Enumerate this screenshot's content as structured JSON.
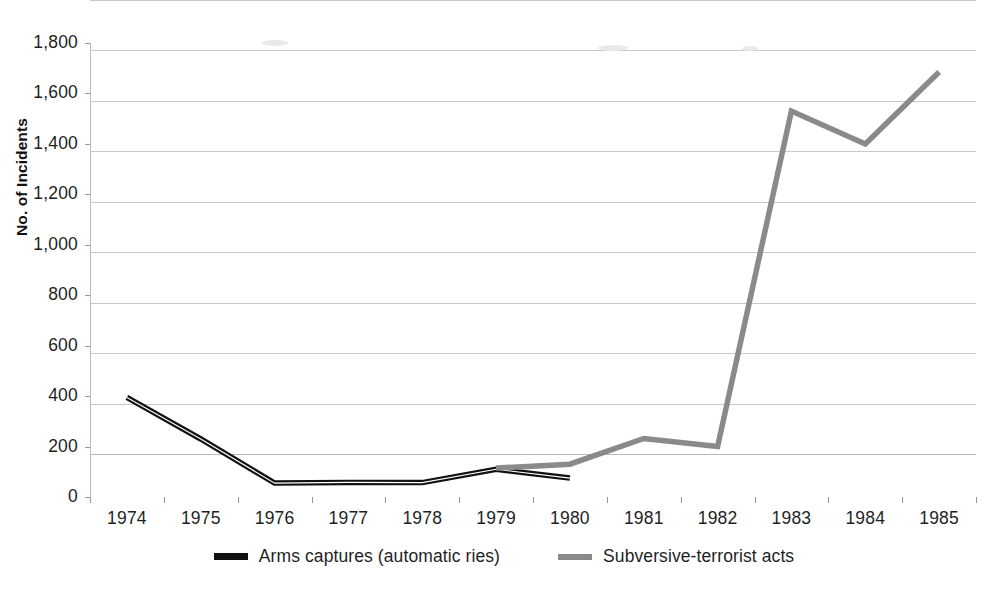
{
  "chart_data": {
    "type": "line",
    "title": "",
    "xlabel": "",
    "ylabel": "No. of Incidents",
    "categories": [
      "1974",
      "1975",
      "1976",
      "1977",
      "1978",
      "1979",
      "1980",
      "1981",
      "1982",
      "1983",
      "1984",
      "1985"
    ],
    "ylim": [
      0,
      1800
    ],
    "y_ticks": [
      0,
      200,
      400,
      600,
      800,
      1000,
      1200,
      1400,
      1600,
      1800
    ],
    "y_tick_labels": [
      "0",
      "200",
      "400",
      "600",
      "800",
      "1,000",
      "1,200",
      "1,400",
      "1,600",
      "1,800"
    ],
    "grid": true,
    "legend_position": "bottom",
    "series": [
      {
        "name": "Arms captures (automatic ries)",
        "color": "#111111",
        "x": [
          "1974",
          "1975",
          "1976",
          "1977",
          "1978",
          "1979",
          "1980"
        ],
        "values": [
          395,
          230,
          55,
          58,
          57,
          110,
          75
        ]
      },
      {
        "name": "Subversive-terrorist acts",
        "color": "#8a8a8a",
        "x": [
          "1979",
          "1980",
          "1981",
          "1982",
          "1983",
          "1984",
          "1985"
        ],
        "values": [
          115,
          130,
          232,
          200,
          1530,
          1400,
          1685
        ]
      }
    ]
  },
  "axes": {
    "y_title": "No. of Incidents",
    "y_labels": [
      "1,800",
      "1,600",
      "1,400",
      "1,200",
      "1,000",
      "800",
      "600",
      "400",
      "200",
      "0"
    ],
    "x_labels": [
      "1974",
      "1975",
      "1976",
      "1977",
      "1978",
      "1979",
      "1980",
      "1981",
      "1982",
      "1983",
      "1984",
      "1985"
    ]
  },
  "legend": {
    "items": [
      {
        "label": "Arms captures (automatic ries)",
        "swatch": "dark",
        "color": "#111111"
      },
      {
        "label": "Subversive-terrorist acts",
        "swatch": "grey",
        "color": "#8a8a8a"
      }
    ]
  },
  "colors": {
    "series_dark": "#111111",
    "series_grey": "#8a8a8a",
    "gridline": "#c9c9c9",
    "axis": "#b9b9b9",
    "background": "#ffffff",
    "text": "#1f1f1f"
  }
}
